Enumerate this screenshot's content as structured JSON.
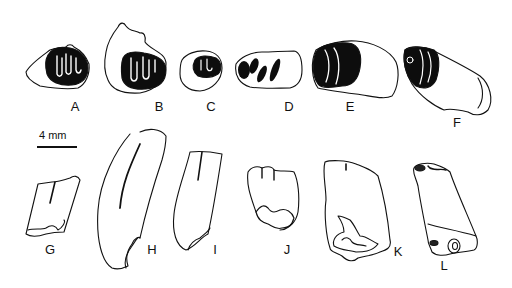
{
  "figure": {
    "scale_bar": {
      "label": "4 mm",
      "x": 37,
      "y": 146,
      "length": 40
    },
    "colors": {
      "ink": "#111111",
      "enamel": "#0d0d0d",
      "background": "#ffffff"
    },
    "specimens": [
      {
        "id": "A",
        "label": "A",
        "view": "occlusal",
        "label_x": 75,
        "label_y": 100
      },
      {
        "id": "B",
        "label": "B",
        "view": "occlusal",
        "label_x": 159,
        "label_y": 100
      },
      {
        "id": "C",
        "label": "C",
        "view": "occlusal",
        "label_x": 211,
        "label_y": 100
      },
      {
        "id": "D",
        "label": "D",
        "view": "occlusal",
        "label_x": 289,
        "label_y": 100
      },
      {
        "id": "E",
        "label": "E",
        "view": "occlusal",
        "label_x": 350,
        "label_y": 100
      },
      {
        "id": "F",
        "label": "F",
        "view": "occlusal",
        "label_x": 457,
        "label_y": 116
      },
      {
        "id": "G",
        "label": "G",
        "view": "lateral",
        "label_x": 50,
        "label_y": 243
      },
      {
        "id": "H",
        "label": "H",
        "view": "lateral",
        "label_x": 152,
        "label_y": 243
      },
      {
        "id": "I",
        "label": "I",
        "view": "lateral",
        "label_x": 215,
        "label_y": 243
      },
      {
        "id": "J",
        "label": "J",
        "view": "lateral",
        "label_x": 287,
        "label_y": 243
      },
      {
        "id": "K",
        "label": "K",
        "view": "lateral",
        "label_x": 398,
        "label_y": 245
      },
      {
        "id": "L",
        "label": "L",
        "view": "lateral",
        "label_x": 444,
        "label_y": 259
      }
    ]
  }
}
